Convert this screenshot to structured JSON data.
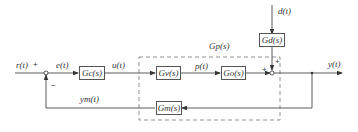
{
  "diagram": {
    "type": "control-system-block-diagram",
    "blocks": {
      "controller": "Gc(s)",
      "valve": "Gv(s)",
      "process": "Go(s)",
      "measurement": "Gm(s)",
      "disturbance": "Gd(s)",
      "generalized_process": "Gp(s)"
    },
    "signals": {
      "reference": "r(t)",
      "error": "e(t)",
      "control": "u(t)",
      "manipulated": "p(t)",
      "disturbance": "d(t)",
      "output": "y(t)",
      "measured": "ym(t)"
    },
    "signs": {
      "ref_plus": "+",
      "feedback_minus": "−",
      "dist_plus": "+",
      "process_plus": "+"
    },
    "colors": {
      "line": "#333333",
      "dashed": "#777777",
      "background": "#ffffff"
    }
  }
}
